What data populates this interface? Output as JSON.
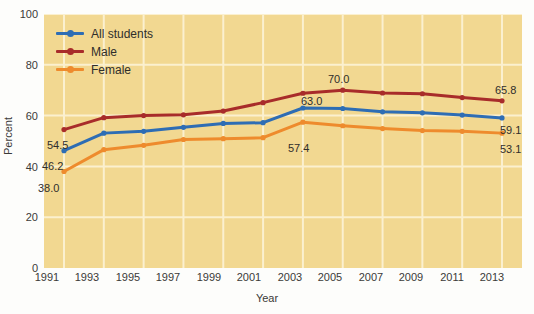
{
  "chart_data": {
    "type": "line",
    "title": "",
    "xlabel": "Year",
    "ylabel": "Percent",
    "grid": true,
    "legend_position": "top-left",
    "ylim": [
      0,
      100
    ],
    "yticks": [
      0,
      20,
      40,
      60,
      80,
      100
    ],
    "categories": [
      "1991",
      "1993",
      "1995",
      "1997",
      "1999",
      "2001",
      "2003",
      "2005",
      "2007",
      "2009",
      "2011",
      "2013"
    ],
    "series": [
      {
        "name": "All students",
        "color": "#2E6DB4",
        "values": [
          46.2,
          53.1,
          53.8,
          55.4,
          56.9,
          57.2,
          63.0,
          62.8,
          61.5,
          61.1,
          60.2,
          59.1
        ]
      },
      {
        "name": "Male",
        "color": "#A82C2A",
        "values": [
          54.5,
          59.2,
          60.0,
          60.3,
          61.8,
          65.1,
          68.8,
          70.0,
          68.9,
          68.6,
          67.1,
          65.8
        ]
      },
      {
        "name": "Female",
        "color": "#EE8B2D",
        "values": [
          38.0,
          46.6,
          48.3,
          50.6,
          50.9,
          51.3,
          57.4,
          56.0,
          54.9,
          54.1,
          53.8,
          53.1
        ]
      }
    ],
    "annotations": [
      {
        "text": "54.5",
        "series": "Male",
        "category": "1991",
        "value": 54.5,
        "placement": "below-right"
      },
      {
        "text": "46.2",
        "series": "All students",
        "category": "1991",
        "value": 46.2,
        "placement": "below-right"
      },
      {
        "text": "38.0",
        "series": "Female",
        "category": "1991",
        "value": 38.0,
        "placement": "below-right"
      },
      {
        "text": "70.0",
        "series": "Male",
        "category": "2005",
        "value": 70.0,
        "placement": "above"
      },
      {
        "text": "63.0",
        "series": "All students",
        "category": "2003",
        "value": 63.0,
        "placement": "above-right"
      },
      {
        "text": "57.4",
        "series": "Female",
        "category": "2003",
        "value": 57.4,
        "placement": "below"
      },
      {
        "text": "65.8",
        "series": "Male",
        "category": "2013",
        "value": 65.8,
        "placement": "above-left"
      },
      {
        "text": "59.1",
        "series": "All students",
        "category": "2013",
        "value": 59.1,
        "placement": "below-left"
      },
      {
        "text": "53.1",
        "series": "Female",
        "category": "2013",
        "value": 53.1,
        "placement": "below-left"
      }
    ]
  },
  "axes": {
    "y_label": "Percent",
    "x_label": "Year",
    "y_ticks": [
      "100",
      "80",
      "60",
      "40",
      "20",
      "0"
    ],
    "x_ticks": [
      "1991",
      "1993",
      "1995",
      "1997",
      "1999",
      "2001",
      "2003",
      "2005",
      "2007",
      "2009",
      "2011",
      "2013"
    ]
  },
  "legend": {
    "items": [
      {
        "label": "All students",
        "color": "#2E6DB4"
      },
      {
        "label": "Male",
        "color": "#A82C2A"
      },
      {
        "label": "Female",
        "color": "#EE8B2D"
      }
    ]
  },
  "labels": {
    "l_54_5": "54.5",
    "l_46_2": "46.2",
    "l_38_0": "38.0",
    "l_70_0": "70.0",
    "l_63_0": "63.0",
    "l_57_4": "57.4",
    "l_65_8": "65.8",
    "l_59_1": "59.1",
    "l_53_1": "53.1"
  },
  "colors": {
    "plot_background": "#f2d891",
    "gridline": "#fbf0cf",
    "text": "#2f2e2c",
    "all_students": "#2E6DB4",
    "male": "#A82C2A",
    "female": "#EE8B2D"
  }
}
